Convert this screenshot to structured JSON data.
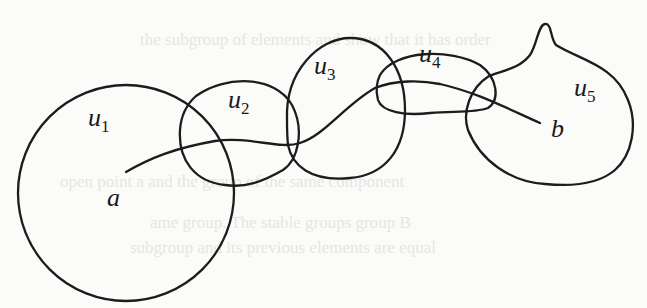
{
  "figure": {
    "sets": [
      {
        "id": "u1",
        "label": "u",
        "sub": "1"
      },
      {
        "id": "u2",
        "label": "u",
        "sub": "2"
      },
      {
        "id": "u3",
        "label": "u",
        "sub": "3"
      },
      {
        "id": "u4",
        "label": "u",
        "sub": "4"
      },
      {
        "id": "u5",
        "label": "u",
        "sub": "5"
      }
    ],
    "points": [
      {
        "id": "a",
        "label": "a"
      },
      {
        "id": "b",
        "label": "b"
      }
    ],
    "path": {
      "from": "a",
      "to": "b"
    }
  },
  "bleed_through": {
    "line1": "the subgroup of elements and show that it has order",
    "line2": "open point a and the group of the same component",
    "line3": "ame group. The stable groups group B",
    "line4": "subgroup and its previous elements are equal"
  }
}
